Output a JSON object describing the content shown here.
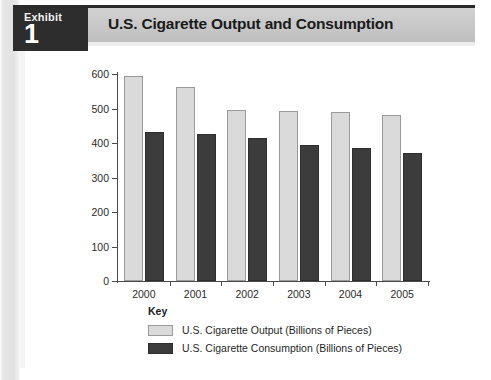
{
  "header": {
    "exhibit_word": "Exhibit",
    "exhibit_number": "1",
    "title": "U.S. Cigarette Output and Consumption"
  },
  "legend": {
    "title": "Key",
    "items": [
      {
        "label": "U.S. Cigarette Output (Billions of Pieces)",
        "color": "#dadada"
      },
      {
        "label": "U.S. Cigarette Consumption (Billions of Pieces)",
        "color": "#3c3c3c"
      }
    ]
  },
  "colors": {
    "output_bar": "#dadada",
    "consumption_bar": "#3c3c3c",
    "badge_background": "#2d2d2d",
    "title_bar_background": "#c9c9c9",
    "axis": "#4a4a4a"
  },
  "chart_data": {
    "type": "bar",
    "title": "U.S. Cigarette Output and Consumption",
    "xlabel": "",
    "ylabel": "",
    "ylim": [
      0,
      600
    ],
    "yticks": [
      0,
      100,
      200,
      300,
      400,
      500,
      600
    ],
    "grid": false,
    "legend_position": "bottom",
    "categories": [
      "2000",
      "2001",
      "2002",
      "2003",
      "2004",
      "2005"
    ],
    "series": [
      {
        "name": "U.S. Cigarette Output (Billions of Pieces)",
        "color": "#dadada",
        "values": [
          595,
          562,
          495,
          494,
          490,
          482
        ]
      },
      {
        "name": "U.S. Cigarette Consumption (Billions of Pieces)",
        "color": "#3c3c3c",
        "values": [
          432,
          425,
          415,
          393,
          385,
          370
        ]
      }
    ]
  }
}
